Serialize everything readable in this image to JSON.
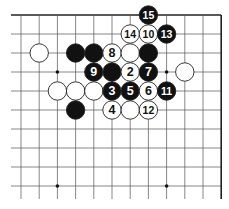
{
  "diagram": {
    "type": "go-board-fragment",
    "grid": {
      "columns": 12,
      "rows": 10,
      "x0": 21,
      "dx": 18.2,
      "y0": 15,
      "dy": 19,
      "top_edge": true,
      "right_edge": true,
      "left_edge": false,
      "bottom_edge": false
    },
    "colors": {
      "black": "#111111",
      "white": "#ffffff",
      "line": "#555555",
      "edge": "#222222"
    },
    "star_points": [
      [
        2,
        3
      ],
      [
        8,
        3
      ],
      [
        2,
        9
      ],
      [
        8,
        9
      ]
    ],
    "stones": [
      {
        "color": "white",
        "col": 1,
        "row": 2,
        "label": ""
      },
      {
        "color": "black",
        "col": 3,
        "row": 2,
        "label": ""
      },
      {
        "color": "black",
        "col": 4,
        "row": 2,
        "label": ""
      },
      {
        "color": "white",
        "col": 5,
        "row": 2,
        "label": "8"
      },
      {
        "color": "white",
        "col": 6,
        "row": 2,
        "label": ""
      },
      {
        "color": "black",
        "col": 7,
        "row": 2,
        "label": ""
      },
      {
        "color": "black",
        "col": 4,
        "row": 3,
        "label": "9"
      },
      {
        "color": "black",
        "col": 5,
        "row": 3,
        "label": ""
      },
      {
        "color": "white",
        "col": 6,
        "row": 3,
        "label": "2"
      },
      {
        "color": "black",
        "col": 7,
        "row": 3,
        "label": "7"
      },
      {
        "color": "white",
        "col": 9,
        "row": 3,
        "label": ""
      },
      {
        "color": "white",
        "col": 2,
        "row": 4,
        "label": ""
      },
      {
        "color": "white",
        "col": 3,
        "row": 4,
        "label": ""
      },
      {
        "color": "white",
        "col": 4,
        "row": 4,
        "label": ""
      },
      {
        "color": "black",
        "col": 5,
        "row": 4,
        "label": "3"
      },
      {
        "color": "black",
        "col": 6,
        "row": 4,
        "label": "5"
      },
      {
        "color": "white",
        "col": 7,
        "row": 4,
        "label": "6"
      },
      {
        "color": "black",
        "col": 8,
        "row": 4,
        "label": "11"
      },
      {
        "color": "black",
        "col": 3,
        "row": 5,
        "label": ""
      },
      {
        "color": "white",
        "col": 5,
        "row": 5,
        "label": "4"
      },
      {
        "color": "white",
        "col": 6,
        "row": 5,
        "label": ""
      },
      {
        "color": "white",
        "col": 7,
        "row": 5,
        "label": "12"
      },
      {
        "color": "white",
        "col": 6,
        "row": 1,
        "label": "14"
      },
      {
        "color": "white",
        "col": 7,
        "row": 1,
        "label": "10"
      },
      {
        "color": "black",
        "col": 8,
        "row": 1,
        "label": "13"
      },
      {
        "color": "black",
        "col": 7,
        "row": 0,
        "label": "15"
      }
    ]
  }
}
